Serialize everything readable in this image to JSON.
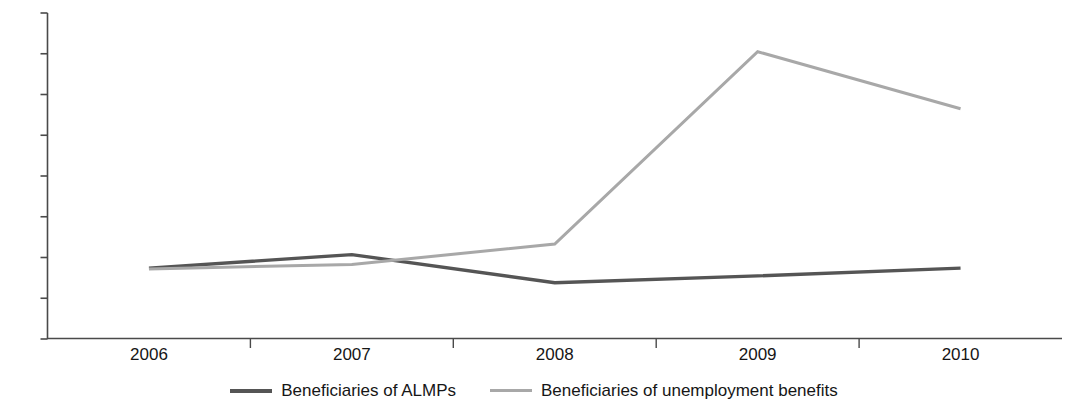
{
  "chart_data": {
    "type": "line",
    "title": "",
    "subtitle": "",
    "xlabel": "",
    "ylabel": "",
    "categories": [
      "2006",
      "2007",
      "2008",
      "2009",
      "2010"
    ],
    "x_tick_labels": [
      "2006",
      "2007",
      "2008",
      "2009",
      "2010"
    ],
    "y_tick_labels": [
      "0",
      "10",
      "20",
      "30",
      "40",
      "50",
      "60",
      "70",
      "80"
    ],
    "y_ticks": [
      0,
      10,
      20,
      30,
      40,
      50,
      60,
      70,
      80
    ],
    "ylim": [
      0,
      80
    ],
    "grid": false,
    "legend_position": "bottom",
    "series": [
      {
        "name": "Beneficiaries of ALMPs",
        "color": "#555555",
        "values": [
          17.4,
          20.7,
          13.8,
          15.5,
          17.4
        ]
      },
      {
        "name": "Beneficiaries of unemployment benefits",
        "color": "#a8a8a8",
        "values": [
          17.2,
          18.3,
          23.3,
          70.5,
          56.5
        ]
      }
    ]
  },
  "axes": {
    "axis_color": "#4a4a4a"
  },
  "legend": {
    "items": [
      {
        "label": "Beneficiaries of ALMPs",
        "color": "#555555"
      },
      {
        "label": "Beneficiaries of unemployment benefits",
        "color": "#a8a8a8"
      }
    ]
  }
}
